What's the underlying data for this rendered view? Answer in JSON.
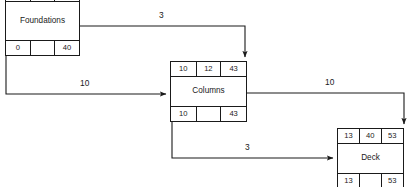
{
  "diagram": {
    "type": "activity-on-node-network",
    "nodes": [
      {
        "id": "foundations",
        "name": "Foundations",
        "top_row": [
          "0",
          "40",
          "40"
        ],
        "bottom_row": [
          "0",
          "",
          "40"
        ]
      },
      {
        "id": "columns",
        "name": "Columns",
        "top_row": [
          "10",
          "12",
          "43"
        ],
        "bottom_row": [
          "10",
          "",
          "43"
        ]
      },
      {
        "id": "deck",
        "name": "Deck",
        "top_row": [
          "13",
          "40",
          "53"
        ],
        "bottom_row": [
          "13",
          "",
          "53"
        ]
      }
    ],
    "edges": [
      {
        "id": "foundations-to-columns-top",
        "from": "foundations",
        "to": "columns",
        "label": "3"
      },
      {
        "id": "foundations-to-columns-left",
        "from": "foundations",
        "to": "columns",
        "label": "10"
      },
      {
        "id": "columns-to-deck-top",
        "from": "columns",
        "to": "deck",
        "label": "10"
      },
      {
        "id": "columns-to-deck-left",
        "from": "columns",
        "to": "deck",
        "label": "3"
      }
    ],
    "colors": {
      "stroke": "#1a1a1a",
      "background": "#ffffff"
    }
  }
}
